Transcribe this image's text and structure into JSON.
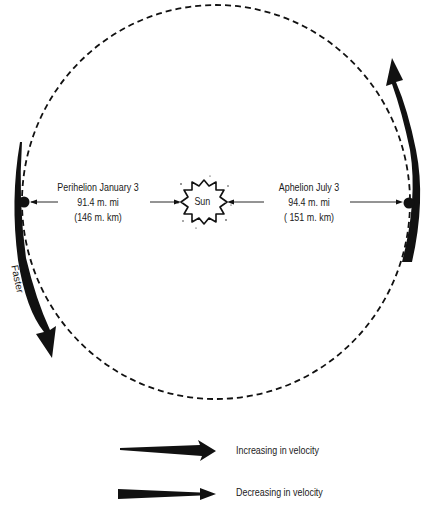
{
  "diagram": {
    "type": "orbit",
    "orbit": {
      "cx": 216,
      "cy": 202,
      "rx": 194,
      "ry": 197,
      "style": "dashed",
      "color": "#111111"
    },
    "sun": {
      "label": "Sun",
      "x": 204,
      "y": 202
    },
    "perihelion": {
      "title": "Perihelion January 3",
      "distance_mi": "91.4 m. mi",
      "distance_km": "(146 m. km)",
      "earth_x": 24,
      "earth_y": 202
    },
    "aphelion": {
      "title": "Aphelion July 3",
      "distance_mi": "94.4 m. mi",
      "distance_km": "( 151 m. km)",
      "earth_x": 409,
      "earth_y": 203
    },
    "motion_label": "Faster",
    "legend": [
      {
        "label": "Increasing in velocity",
        "icon": "tapered-arrow-widening"
      },
      {
        "label": "Decreasing in velocity",
        "icon": "tapered-arrow-narrowing"
      }
    ],
    "colors": {
      "ink": "#111111",
      "background": "#ffffff"
    }
  }
}
